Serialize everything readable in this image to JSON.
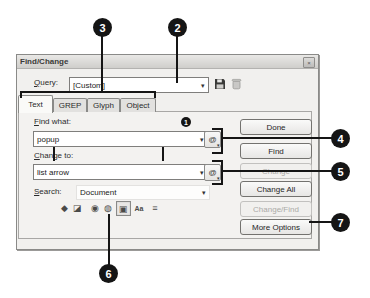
{
  "callouts": {
    "n1": "1",
    "n2": "2",
    "n3": "3",
    "n4": "4",
    "n5": "5",
    "n6": "6",
    "n7": "7"
  },
  "window": {
    "title": "Find/Change",
    "close_glyph": "×"
  },
  "query": {
    "label_accel": "Q",
    "label_rest": "uery:",
    "value": "[Custom]"
  },
  "tabs": [
    {
      "label": "Text",
      "active": true
    },
    {
      "label": "GREP",
      "active": false
    },
    {
      "label": "Glyph",
      "active": false
    },
    {
      "label": "Object",
      "active": false
    }
  ],
  "find_what": {
    "label_accel": "F",
    "label_rest": "ind what:",
    "value": "popup"
  },
  "change_to": {
    "label_accel": "C",
    "label_rest": "hange to:",
    "value": "list arrow"
  },
  "search": {
    "label_accel": "S",
    "label_rest": "earch:",
    "value": "Document"
  },
  "glyphs": {
    "dropdown_arrow": "▾",
    "at_symbol": "@"
  },
  "option_icons": [
    {
      "name": "include-locked-layers",
      "glyph": "◆",
      "pressed": false
    },
    {
      "name": "include-locked-stories",
      "glyph": "◪",
      "pressed": false
    },
    {
      "name": "include-hidden-layers",
      "glyph": "◉",
      "pressed": false
    },
    {
      "name": "include-master-pages",
      "glyph": "◍",
      "pressed": false
    },
    {
      "name": "include-footnotes",
      "glyph": "▣",
      "pressed": true
    },
    {
      "name": "case-sensitive",
      "glyph": "Aa",
      "pressed": false
    },
    {
      "name": "whole-word",
      "glyph": "≡",
      "pressed": false
    }
  ],
  "buttons": [
    {
      "label": "Done",
      "enabled": true
    },
    {
      "label": "Find",
      "enabled": true
    },
    {
      "label": "Change",
      "enabled": false
    },
    {
      "label": "Change All",
      "enabled": true
    },
    {
      "label": "Change/Find",
      "enabled": false
    },
    {
      "label": "More Options",
      "enabled": true
    }
  ],
  "colors": {
    "callout": "#151515",
    "dialog_bg": "#f1f0ee",
    "border": "#8a8a88"
  }
}
